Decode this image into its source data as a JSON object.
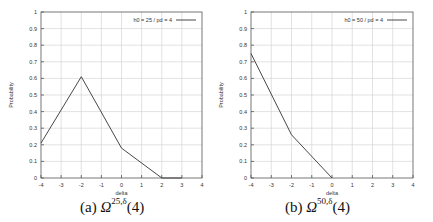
{
  "chart_data": [
    {
      "type": "line",
      "title": "",
      "caption": {
        "label": "(a)",
        "symbol": "Ω",
        "superscript": "25,δ",
        "arg": "(4)"
      },
      "xlabel": "delta",
      "ylabel": "Probability",
      "xlim": [
        -4,
        4
      ],
      "ylim": [
        0,
        1
      ],
      "xticks": [
        "-4",
        "-3",
        "-2",
        "-1",
        "0",
        "1",
        "2",
        "3",
        "4"
      ],
      "yticks": [
        "0",
        "0.1",
        "0.2",
        "0.3",
        "0.4",
        "0.5",
        "0.6",
        "0.7",
        "0.8",
        "0.9",
        "1"
      ],
      "grid": true,
      "legend_position": "top-right",
      "series": [
        {
          "name": "h0 = 25 / pd = 4",
          "x": [
            -4,
            -2,
            0,
            2,
            3
          ],
          "values": [
            0.21,
            0.61,
            0.18,
            0.0,
            0.0
          ]
        }
      ]
    },
    {
      "type": "line",
      "title": "",
      "caption": {
        "label": "(b)",
        "symbol": "Ω",
        "superscript": "50,δ",
        "arg": "(4)"
      },
      "xlabel": "delta",
      "ylabel": "Probability",
      "xlim": [
        -4,
        4
      ],
      "ylim": [
        0,
        1
      ],
      "xticks": [
        "-4",
        "-3",
        "-2",
        "-1",
        "0",
        "1",
        "2",
        "3",
        "4"
      ],
      "yticks": [
        "0",
        "0.1",
        "0.2",
        "0.3",
        "0.4",
        "0.5",
        "0.6",
        "0.7",
        "0.8",
        "0.9",
        "1"
      ],
      "grid": true,
      "legend_position": "top-right",
      "series": [
        {
          "name": "h0 = 50 / pd = 4",
          "x": [
            -4,
            -2,
            0
          ],
          "values": [
            0.75,
            0.26,
            0.0
          ]
        }
      ]
    }
  ],
  "panels": [
    {
      "legend": "h0 = 25 / pd = 4",
      "xlabel": "delta",
      "ylabel": "Probability",
      "caption_label": "(a)",
      "caption_symbol": "Ω",
      "caption_sup": "25,δ",
      "caption_arg": "(4)"
    },
    {
      "legend": "h0 = 50 / pd = 4",
      "xlabel": "delta",
      "ylabel": "Probability",
      "caption_label": "(b)",
      "caption_symbol": "Ω",
      "caption_sup": "50,δ",
      "caption_arg": "(4)"
    }
  ],
  "colors": {
    "line": "#333333",
    "grid": "#cfcfcf",
    "axis": "#555555",
    "text": "#333333"
  }
}
